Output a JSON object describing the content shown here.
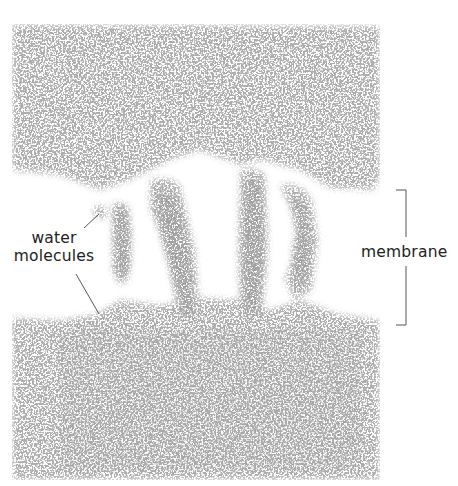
{
  "figure": {
    "labels": {
      "water": "water molecules",
      "water_line1": "water",
      "water_line2": "molecules",
      "membrane": "membrane"
    },
    "colors": {
      "background": "#ffffff",
      "molecules": "#7a7a7a",
      "text": "#222222",
      "lines": "#555555"
    }
  }
}
